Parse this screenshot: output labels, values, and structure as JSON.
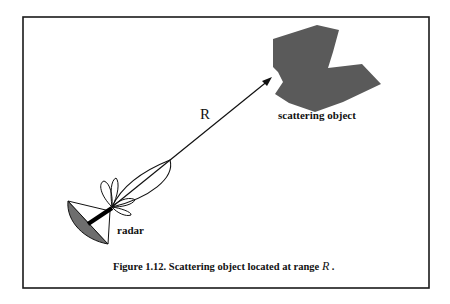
{
  "figure": {
    "caption_prefix": "Figure 1.12. Scattering object located at range ",
    "caption_var": "R",
    "caption_suffix": " .",
    "range_label": "R",
    "object_label": "scattering object",
    "radar_label": "radar"
  },
  "colors": {
    "frame": "#1a1a1a",
    "object_fill": "#5a5a5a",
    "dish_fill": "#6e6e6e",
    "line": "#111111",
    "background": "#ffffff"
  }
}
